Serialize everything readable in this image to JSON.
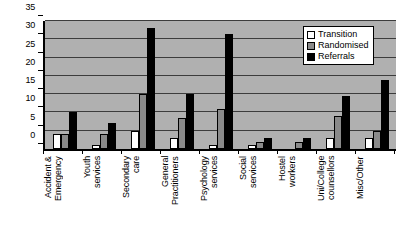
{
  "chart_data": {
    "type": "bar",
    "title": "",
    "xlabel": "",
    "ylabel": "",
    "ylim": [
      0,
      35
    ],
    "ytick_step": 5,
    "yticks": [
      0,
      5,
      10,
      15,
      20,
      25,
      30,
      35
    ],
    "grid": true,
    "legend_position": "top-right",
    "categories": [
      "Accident &\nEmergency",
      "Youth\nservices",
      "Secondary\ncare",
      "General\nPractitioners",
      "Psychology\nservices",
      "Social\nservices",
      "Hostel\nworkers",
      "Uni/College\ncounsellors",
      "Misc/Other"
    ],
    "series": [
      {
        "name": "Transition",
        "color": "#ffffff",
        "values": [
          4,
          1,
          5,
          3,
          1,
          1,
          0,
          3,
          3
        ]
      },
      {
        "name": "Randomised",
        "color": "#8a8a8a",
        "values": [
          4,
          4,
          15,
          8.5,
          11,
          2,
          2,
          9,
          5
        ]
      },
      {
        "name": "Referrals",
        "color": "#000000",
        "values": [
          10,
          7,
          33,
          15,
          31.5,
          3,
          3,
          14.5,
          19
        ]
      }
    ]
  },
  "legend": {
    "items": [
      {
        "label": "Transition",
        "swatch": "transition"
      },
      {
        "label": "Randomised",
        "swatch": "randomised"
      },
      {
        "label": "Referrals",
        "swatch": "referrals"
      }
    ]
  },
  "colors": {
    "plot_background": "#b0b0b0",
    "gridline": "#3c3c3c",
    "axis": "#000000",
    "page_background": "#ffffff"
  }
}
